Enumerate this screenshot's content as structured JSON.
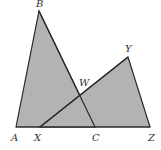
{
  "diagram": {
    "type": "geometry",
    "colors": {
      "fill": "#b3b3b3",
      "stroke": "#2a2a2a",
      "background": "#ffffff",
      "label": "#333333"
    },
    "points": {
      "A": {
        "label": "A",
        "x": 16,
        "y": 127
      },
      "B": {
        "label": "B",
        "x": 39,
        "y": 11
      },
      "C": {
        "label": "C",
        "x": 95,
        "y": 127
      },
      "X": {
        "label": "X",
        "x": 40,
        "y": 127
      },
      "Y": {
        "label": "Y",
        "x": 128,
        "y": 57
      },
      "Z": {
        "label": "Z",
        "x": 150,
        "y": 127
      },
      "W": {
        "label": "W",
        "x": 80,
        "y": 96
      }
    },
    "triangles": [
      {
        "name": "ABC",
        "vertices": [
          "A",
          "B",
          "C"
        ]
      },
      {
        "name": "XYZ",
        "vertices": [
          "X",
          "Y",
          "Z"
        ]
      }
    ],
    "intersection": {
      "point": "W",
      "segments": [
        "BC",
        "XY"
      ]
    }
  }
}
